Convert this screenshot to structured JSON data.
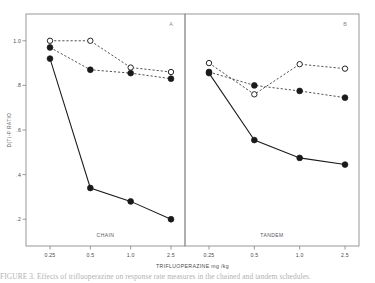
{
  "figure": {
    "caption_fragment": "FIGURE 3.    Effects of trifluoperazine on response rate measures in the chained and tandem schedules.",
    "x_axis_title": "TRIFLUOPERAZINE mg /kg",
    "y_axis_title": "D(T)-P RATIO",
    "panel_a_tag": "A",
    "panel_b_tag": "B",
    "panel_a_name": "CHAIN",
    "panel_b_name": "TANDEM",
    "marker_open_color": "#ffffff",
    "marker_filled_color": "#1a1a1a",
    "line_color": "#1a1a1a",
    "frame_color": "#8d8d8d"
  },
  "chart_data": {
    "type": "line",
    "title": "",
    "xlabel": "TRIFLUOPERAZINE mg /kg",
    "ylabel": "D(T)-P RATIO",
    "x": [
      0.25,
      0.5,
      1.0,
      2.5
    ],
    "xtick_labels": [
      "0.25",
      "0.5",
      "1.0",
      "2.5"
    ],
    "ytick_labels": [
      "1.0",
      ".8",
      ".6",
      ".4",
      ".2"
    ],
    "ytick_values": [
      1.0,
      0.8,
      0.6,
      0.4,
      0.2
    ],
    "ylim": [
      0.08,
      1.12
    ],
    "grid": false,
    "legend": "none",
    "panels": [
      {
        "tag": "A",
        "name": "CHAIN",
        "series": [
          {
            "name": "open-circle-dashed",
            "marker": "open-circle",
            "line": "dashed",
            "values": [
              1.0,
              1.0,
              0.88,
              0.86
            ]
          },
          {
            "name": "filled-circle-dashed",
            "marker": "filled-circle",
            "line": "dashed",
            "values": [
              0.97,
              0.87,
              0.855,
              0.83
            ]
          },
          {
            "name": "filled-circle-solid",
            "marker": "filled-circle",
            "line": "solid",
            "values": [
              0.92,
              0.34,
              0.28,
              0.2
            ]
          }
        ]
      },
      {
        "tag": "B",
        "name": "TANDEM",
        "series": [
          {
            "name": "open-circle-dashed",
            "marker": "open-circle",
            "line": "dashed",
            "values": [
              0.9,
              0.76,
              0.895,
              0.875
            ]
          },
          {
            "name": "filled-circle-dashed",
            "marker": "filled-circle",
            "line": "dashed",
            "values": [
              0.86,
              0.8,
              0.775,
              0.745
            ]
          },
          {
            "name": "filled-circle-solid",
            "marker": "filled-circle",
            "line": "solid",
            "values": [
              0.855,
              0.555,
              0.475,
              0.445
            ]
          }
        ]
      }
    ]
  }
}
